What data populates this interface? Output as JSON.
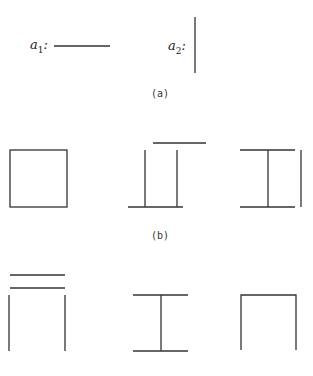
{
  "row_a": {
    "caption": "(a)",
    "primitives": [
      {
        "name": "a",
        "subscript": "1",
        "colon": ":",
        "description": "horizontal line segment"
      },
      {
        "name": "a",
        "subscript": "2",
        "colon": ":",
        "description": "vertical line segment"
      }
    ]
  },
  "row_b": {
    "caption": "(b)",
    "figures": [
      {
        "description": "closed square"
      },
      {
        "description": "two verticals with offset top bar and bottom bar"
      },
      {
        "description": "I-beam with detached right vertical"
      }
    ]
  },
  "row_c": {
    "caption": "",
    "figures": [
      {
        "description": "two stacked horizontal bars over two verticals"
      },
      {
        "description": "I-beam"
      },
      {
        "description": "open-bottom square (arch)"
      }
    ]
  },
  "colors": {
    "stroke": "#333333",
    "background": "#ffffff"
  }
}
